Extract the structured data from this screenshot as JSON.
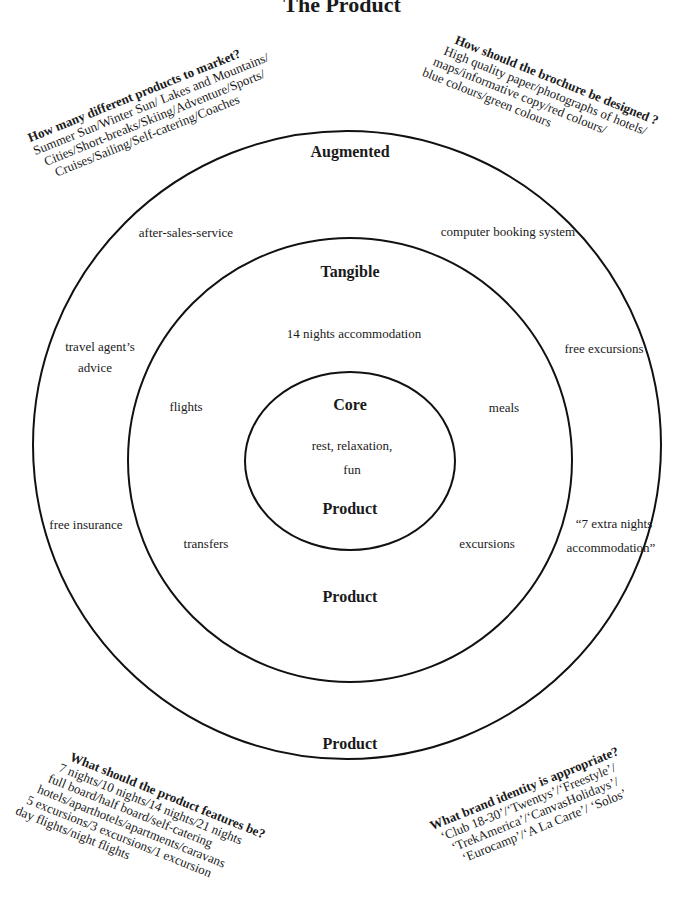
{
  "title": "The Product",
  "rings": {
    "outer": {
      "top_label": "Augmented",
      "bottom_label": "Product"
    },
    "middle": {
      "top_label": "Tangible",
      "bottom_label": "Product"
    },
    "inner": {
      "top_label": "Core",
      "center_text_line1": "rest, relaxation,",
      "center_text_line2": "fun",
      "bottom_label": "Product"
    }
  },
  "augmented_items": {
    "after_sales": "after-sales-service",
    "booking": "computer booking system",
    "travel_agent_line1": "travel agent’s",
    "travel_agent_line2": "advice",
    "free_excursions": "free excursions",
    "free_insurance": "free insurance",
    "extra_nights_line1": "“7 extra nights",
    "extra_nights_line2": "accommodation”"
  },
  "tangible_items": {
    "accommodation": "14 nights accommodation",
    "flights": "flights",
    "meals": "meals",
    "transfers": "transfers",
    "excursions": "excursions"
  },
  "questions": {
    "products": {
      "heading": "How many different products to market?",
      "lines": [
        "Summer Sun/Winter Sun/ Lakes and Mountains/",
        "Cities/Short-breaks/Skiing/Adventure/Sports/",
        "Cruises/Sailing/Self-catering/Coaches"
      ]
    },
    "brochure": {
      "heading": "How should the brochure be designed ?",
      "lines": [
        "High quality paper/photographs of hotels/",
        "maps/informative copy/red colours/",
        "blue colours/green colours"
      ]
    },
    "features": {
      "heading": "What should the product features be?",
      "lines": [
        "7 nights/10 nights/14 nights/21 nights",
        "full board/half board/self-catering",
        "hotels/aparthotels/apartments/caravans",
        "5 excursions/3 excursions/1 excursion",
        "day flights/night flights"
      ]
    },
    "brand": {
      "heading": "What brand identity is appropriate?",
      "lines": [
        "‘Club 18-30’/‘Twentys’/‘Freestyle’/",
        "‘TrekAmerica’/‘CanvasHolidays’/",
        "‘Eurocamp’/‘A La Carte’/ ‘Solos’"
      ]
    }
  }
}
